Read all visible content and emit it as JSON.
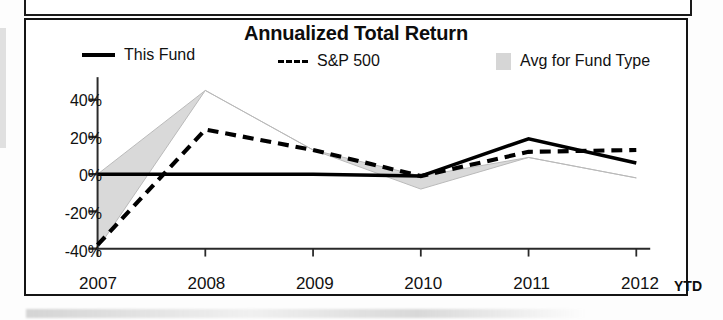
{
  "panel": {
    "title": "Annualized Total Return"
  },
  "legend": {
    "items": [
      {
        "label": "This Fund",
        "style": "solid",
        "swatch": "solid-line-swatch"
      },
      {
        "label": "S&P 500",
        "style": "dashed",
        "swatch": "dashed-line-swatch"
      },
      {
        "label": "Avg for Fund Type",
        "style": "area",
        "swatch": "shaded-area-swatch"
      }
    ]
  },
  "axis": {
    "x_suffix": "YTD",
    "y_ticks": [
      "40%",
      "20%",
      "0%",
      "-20%",
      "-40%"
    ],
    "x_ticks": [
      "2007",
      "2008",
      "2009",
      "2010",
      "2011",
      "2012"
    ]
  },
  "colors": {
    "line_this_fund": "#000000",
    "line_sp500": "#000000",
    "area_avg_fund_type": "#d8d8d8",
    "frame": "#141414",
    "text": "#111111"
  },
  "chart_data": {
    "type": "line",
    "title": "Annualized Total Return",
    "xlabel": "",
    "ylabel": "",
    "x": [
      "2007",
      "2008",
      "2009",
      "2010",
      "2011",
      "2012"
    ],
    "x_last_note": "YTD",
    "ylim": [
      -40,
      50
    ],
    "yticks": [
      -40,
      -20,
      0,
      20,
      40
    ],
    "ytick_labels": [
      "-40%",
      "-20%",
      "0%",
      "20%",
      "40%"
    ],
    "grid": false,
    "legend_position": "top",
    "series": [
      {
        "name": "This Fund",
        "style": "solid",
        "values": [
          0,
          0,
          0,
          -1,
          19,
          6
        ]
      },
      {
        "name": "S&P 500",
        "style": "dashed",
        "values": [
          -38,
          24,
          13,
          -1,
          12,
          13
        ]
      },
      {
        "name": "Avg for Fund Type",
        "style": "area",
        "upper": [
          0,
          45,
          13,
          -1,
          9,
          -2
        ],
        "lower": [
          -40,
          -40,
          -40,
          -40,
          -40,
          -40
        ],
        "values": [
          -40,
          45,
          13,
          -8,
          9,
          -2
        ]
      }
    ]
  }
}
